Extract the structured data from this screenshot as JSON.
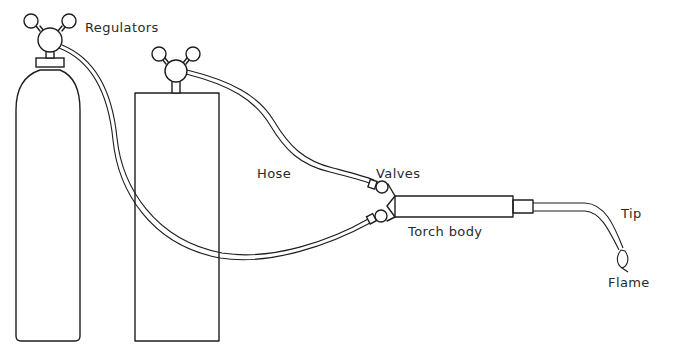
{
  "diagram": {
    "labels": {
      "regulators": "Regulators",
      "hose": "Hose",
      "valves": "Valves",
      "torch_body": "Torch body",
      "tip": "Tip",
      "flame": "Flame"
    },
    "components": [
      {
        "id": "cylinder-tall",
        "shape": "rounded cylinder"
      },
      {
        "id": "cylinder-box",
        "shape": "rectangular tank"
      },
      {
        "id": "regulator-left",
        "gauges": 2
      },
      {
        "id": "regulator-right",
        "gauges": 2
      },
      {
        "id": "hose-1",
        "from": "regulator-left",
        "to": "valve-lower"
      },
      {
        "id": "hose-2",
        "from": "regulator-right",
        "to": "valve-upper"
      },
      {
        "id": "valve-upper"
      },
      {
        "id": "valve-lower"
      },
      {
        "id": "torch-body"
      },
      {
        "id": "tip"
      },
      {
        "id": "flame"
      }
    ],
    "colors": {
      "line": "#1e1e1e",
      "text": "#2a2a2a",
      "background": "#ffffff"
    }
  }
}
